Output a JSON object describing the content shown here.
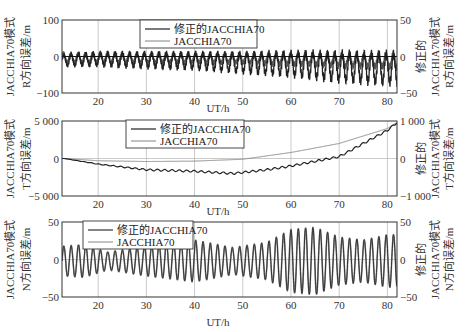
{
  "figure": {
    "xlabel": "UT/h",
    "panels": [
      {
        "id": "R",
        "left_ylabel_line1": "JACCHIA70模式",
        "left_ylabel_line2": "R方向误差/m",
        "right_ylabel_line1": "修正的",
        "right_ylabel_line2": "JACCHIA70模式",
        "right_ylabel_line3": "R方向误差/m",
        "left_ticks": [
          "100",
          "0",
          "−100"
        ],
        "right_ticks": [
          "50",
          "0",
          "−50"
        ],
        "x_ticks": [
          "20",
          "30",
          "40",
          "50",
          "60",
          "70",
          "80"
        ],
        "legend": [
          "修正的JACCHIA70",
          "JACCHIA70"
        ]
      },
      {
        "id": "T",
        "left_ylabel_line1": "JACCHIA70模式",
        "left_ylabel_line2": "T方向误差/m",
        "right_ylabel_line1": "修正的",
        "right_ylabel_line2": "JACCHIA70模式",
        "right_ylabel_line3": "T方向误差/m",
        "left_ticks": [
          "5 000",
          "0",
          "−5 000"
        ],
        "right_ticks": [
          "1 000",
          "0",
          "−1 000"
        ],
        "x_ticks": [
          "20",
          "30",
          "40",
          "50",
          "60",
          "70",
          "80"
        ],
        "legend": [
          "修正的JACCHIA70",
          "JACCHIA70"
        ]
      },
      {
        "id": "N",
        "left_ylabel_line1": "JACCHIA70模式",
        "left_ylabel_line2": "N方向误差/m",
        "right_ylabel_line1": "修正的",
        "right_ylabel_line2": "JACCHIA70模式",
        "right_ylabel_line3": "N方向误差/m",
        "left_ticks": [
          "50",
          "0",
          "−50"
        ],
        "right_ticks": [
          "50",
          "0",
          "−50"
        ],
        "x_ticks": [
          "20",
          "30",
          "40",
          "50",
          "60",
          "70",
          "80"
        ],
        "legend": [
          "修正的JACCHIA70",
          "JACCHIA70"
        ]
      }
    ]
  },
  "chart_data": [
    {
      "type": "line",
      "title": "R方向误差",
      "xlabel": "UT/h",
      "ylabel": "JACCHIA70模式 R方向误差/m",
      "ylabel_right": "修正的JACCHIA70模式 R方向误差/m",
      "xlim": [
        12.5,
        82
      ],
      "ylim": [
        -100,
        100
      ],
      "ylim_right": [
        -50,
        50
      ],
      "x_ticks": [
        20,
        30,
        40,
        50,
        60,
        70,
        80
      ],
      "grid": true,
      "legend_position": "upper center",
      "series": [
        {
          "name": "修正的JACCHIA70",
          "axis": "right",
          "description": "oscillation ~1.5 h period, centered slightly below 0; amplitude grows from ~±10 m at start to ~±25 m (dips to ~-40 m) near 75-82 h",
          "x": [
            13,
            20,
            30,
            40,
            50,
            60,
            70,
            80
          ],
          "envelope_min": [
            -15,
            -15,
            -18,
            -20,
            -25,
            -30,
            -38,
            -42
          ],
          "envelope_max": [
            5,
            8,
            8,
            8,
            8,
            10,
            10,
            10
          ]
        },
        {
          "name": "JACCHIA70",
          "axis": "left",
          "description": "dense high-frequency oscillation overlapping, approx ±20 m around 0",
          "x": [
            13,
            20,
            30,
            40,
            50,
            60,
            70,
            80
          ],
          "envelope_min": [
            -25,
            -25,
            -25,
            -25,
            -25,
            -30,
            -35,
            -40
          ],
          "envelope_max": [
            15,
            15,
            15,
            15,
            15,
            15,
            15,
            15
          ]
        }
      ]
    },
    {
      "type": "line",
      "title": "T方向误差",
      "xlabel": "UT/h",
      "ylabel": "JACCHIA70模式 T方向误差/m",
      "ylabel_right": "修正的JACCHIA70模式 T方向误差/m",
      "xlim": [
        12.5,
        82
      ],
      "ylim": [
        -5000,
        5000
      ],
      "ylim_right": [
        -1000,
        1000
      ],
      "x_ticks": [
        20,
        30,
        40,
        50,
        60,
        70,
        80
      ],
      "grid": true,
      "legend_position": "upper center",
      "series": [
        {
          "name": "修正的JACCHIA70",
          "axis": "right",
          "description": "smooth descent to minimum near 48 h then rise, small ripples",
          "x": [
            13,
            20,
            30,
            40,
            48,
            55,
            60,
            70,
            80,
            82
          ],
          "y": [
            0,
            -150,
            -300,
            -340,
            -400,
            -300,
            -200,
            50,
            750,
            960
          ]
        },
        {
          "name": "JACCHIA70",
          "axis": "left",
          "description": "nearly flat near zero until ~45 h then grows roughly parabolically",
          "x": [
            13,
            20,
            30,
            40,
            50,
            60,
            70,
            80,
            82
          ],
          "y": [
            0,
            -300,
            -400,
            -350,
            -100,
            800,
            2000,
            4000,
            4800
          ]
        }
      ]
    },
    {
      "type": "line",
      "title": "N方向误差",
      "xlabel": "UT/h",
      "ylabel": "JACCHIA70模式 N方向误差/m",
      "ylabel_right": "修正的JACCHIA70模式 N方向误差/m",
      "xlim": [
        12.5,
        82
      ],
      "ylim": [
        -50,
        50
      ],
      "ylim_right": [
        -50,
        50
      ],
      "x_ticks": [
        20,
        30,
        40,
        50,
        60,
        70,
        80
      ],
      "grid": true,
      "legend_position": "upper left",
      "series": [
        {
          "name": "修正的JACCHIA70",
          "axis": "right",
          "description": "sinusoid ~1.5 h period; amplitude ~±20 at 15 h, ~±12 at 20 h, grows to ~±30 at 40 h, ~±18 at 50 h, peaks ~±45 at 60-65 h, ~±30 at 70-80 h",
          "x": [
            13,
            17,
            22,
            30,
            40,
            48,
            55,
            60,
            65,
            70,
            75,
            80
          ],
          "amplitude": [
            20,
            22,
            12,
            20,
            28,
            18,
            25,
            42,
            45,
            32,
            28,
            35
          ]
        },
        {
          "name": "JACCHIA70",
          "axis": "left",
          "description": "overlaps the corrected series nearly identically",
          "x": [
            13,
            17,
            22,
            30,
            40,
            48,
            55,
            60,
            65,
            70,
            75,
            80
          ],
          "amplitude": [
            20,
            22,
            12,
            20,
            28,
            18,
            25,
            42,
            45,
            32,
            28,
            35
          ]
        }
      ]
    }
  ]
}
